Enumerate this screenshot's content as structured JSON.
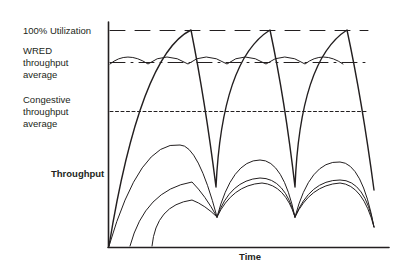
{
  "labels": {
    "utilization": "100% Utilization",
    "wred_line1": "WRED",
    "wred_line2": "throughput",
    "wred_line3": "average",
    "congestive_line1": "Congestive",
    "congestive_line2": "throughput",
    "congestive_line3": "average",
    "y_axis": "Throughput",
    "x_axis": "Time"
  },
  "colors": {
    "ink": "#231f20",
    "background": "#ffffff"
  }
}
